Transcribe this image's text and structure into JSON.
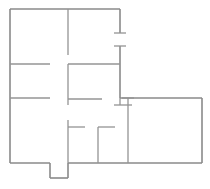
{
  "document": {
    "title": "Floor Plan",
    "type": "architectural-floor-plan",
    "canvas": {
      "width": 210,
      "height": 189,
      "background": "#ffffff"
    }
  },
  "style": {
    "wall_color": "#8f8f8f",
    "exterior_wall_color": "#8a8a8a",
    "interior_wall_color": "#949494",
    "exterior_wall_thickness": 1.6,
    "interior_wall_thickness": 1.3,
    "door_jamb_thickness": 1.3
  },
  "geometry": {
    "exterior_outline": {
      "name": "building-outline",
      "points": [
        [
          10,
          9
        ],
        [
          120,
          9
        ],
        [
          120,
          33
        ],
        [
          120,
          46
        ],
        [
          120,
          98
        ],
        [
          202,
          98
        ],
        [
          202,
          163
        ],
        [
          68,
          163
        ],
        [
          68,
          178
        ],
        [
          50,
          178
        ],
        [
          50,
          163
        ],
        [
          10,
          163
        ]
      ],
      "description": "L-shaped building footprint with small bottom alcove notch"
    },
    "exterior_segments": [
      {
        "name": "exterior-wall-top",
        "x1": 10,
        "y1": 9,
        "x2": 120,
        "y2": 9,
        "orientation": "horizontal"
      },
      {
        "name": "exterior-wall-left",
        "x1": 10,
        "y1": 9,
        "x2": 10,
        "y2": 163,
        "orientation": "vertical"
      },
      {
        "name": "exterior-wall-right-upper",
        "x1": 120,
        "y1": 9,
        "x2": 120,
        "y2": 33,
        "orientation": "vertical"
      },
      {
        "name": "exterior-wall-right-middle",
        "x1": 120,
        "y1": 46,
        "x2": 120,
        "y2": 98,
        "orientation": "vertical"
      },
      {
        "name": "exterior-wall-wing-top",
        "x1": 120,
        "y1": 98,
        "x2": 202,
        "y2": 98,
        "orientation": "horizontal"
      },
      {
        "name": "exterior-wall-wing-right",
        "x1": 202,
        "y1": 98,
        "x2": 202,
        "y2": 163,
        "orientation": "vertical"
      },
      {
        "name": "exterior-wall-bottom-right",
        "x1": 202,
        "y1": 163,
        "x2": 68,
        "y2": 163,
        "orientation": "horizontal"
      },
      {
        "name": "exterior-wall-bottom-left",
        "x1": 50,
        "y1": 163,
        "x2": 10,
        "y2": 163,
        "orientation": "horizontal"
      },
      {
        "name": "alcove-wall-right",
        "x1": 68,
        "y1": 163,
        "x2": 68,
        "y2": 178,
        "orientation": "vertical"
      },
      {
        "name": "alcove-wall-bottom",
        "x1": 68,
        "y1": 178,
        "x2": 50,
        "y2": 178,
        "orientation": "horizontal"
      },
      {
        "name": "alcove-wall-left",
        "x1": 50,
        "y1": 178,
        "x2": 50,
        "y2": 163,
        "orientation": "vertical"
      }
    ],
    "interior_segments": [
      {
        "name": "interior-wall-upper-vertical-divider",
        "x1": 68,
        "y1": 9,
        "x2": 68,
        "y2": 55,
        "orientation": "vertical"
      },
      {
        "name": "interior-wall-left-upper-partition",
        "x1": 10,
        "y1": 64,
        "x2": 50,
        "y2": 64,
        "orientation": "horizontal"
      },
      {
        "name": "interior-wall-left-lower-partition",
        "x1": 10,
        "y1": 98,
        "x2": 50,
        "y2": 98,
        "orientation": "horizontal"
      },
      {
        "name": "interior-wall-center-room-top",
        "x1": 68,
        "y1": 64,
        "x2": 120,
        "y2": 64,
        "orientation": "horizontal"
      },
      {
        "name": "interior-wall-center-room-left",
        "x1": 68,
        "y1": 64,
        "x2": 68,
        "y2": 105,
        "orientation": "vertical"
      },
      {
        "name": "interior-wall-center-room-bottom",
        "x1": 68,
        "y1": 99,
        "x2": 102,
        "y2": 99,
        "orientation": "horizontal"
      },
      {
        "name": "interior-wall-center-room-right",
        "x1": 120,
        "y1": 98,
        "x2": 120,
        "y2": 105,
        "orientation": "vertical"
      },
      {
        "name": "interior-wall-lower-vertical-divider",
        "x1": 68,
        "y1": 120,
        "x2": 68,
        "y2": 163,
        "orientation": "vertical"
      },
      {
        "name": "interior-wall-closet-left-stub",
        "x1": 68,
        "y1": 127,
        "x2": 85,
        "y2": 127,
        "orientation": "horizontal"
      },
      {
        "name": "interior-wall-closet-right-stub",
        "x1": 98,
        "y1": 127,
        "x2": 115,
        "y2": 127,
        "orientation": "horizontal"
      },
      {
        "name": "interior-wall-closet-vertical",
        "x1": 98,
        "y1": 127,
        "x2": 98,
        "y2": 163,
        "orientation": "vertical"
      },
      {
        "name": "interior-wall-wing-divider",
        "x1": 128,
        "y1": 98,
        "x2": 128,
        "y2": 163,
        "orientation": "vertical"
      }
    ],
    "door_jambs": [
      {
        "name": "door-jamb-right-upper",
        "x1": 114,
        "y1": 33,
        "x2": 126,
        "y2": 33,
        "orientation": "horizontal"
      },
      {
        "name": "door-jamb-right-lower",
        "x1": 114,
        "y1": 46,
        "x2": 126,
        "y2": 46,
        "orientation": "horizontal"
      },
      {
        "name": "door-jamb-wing-entry",
        "x1": 122,
        "y1": 98,
        "x2": 134,
        "y2": 98,
        "orientation": "horizontal"
      },
      {
        "name": "door-jamb-center-lower",
        "x1": 114,
        "y1": 105,
        "x2": 132,
        "y2": 105,
        "orientation": "horizontal"
      }
    ],
    "door_openings": [
      {
        "name": "door-opening-right-wall",
        "wall": "exterior-wall-right",
        "from": [
          120,
          33
        ],
        "to": [
          120,
          46
        ],
        "width": 13
      },
      {
        "name": "door-opening-bottom-alcove",
        "wall": "exterior-wall-bottom",
        "from": [
          50,
          163
        ],
        "to": [
          68,
          163
        ],
        "width": 18
      },
      {
        "name": "door-opening-left-upper-partition",
        "wall": "interior-wall-left-upper-partition",
        "from": [
          50,
          64
        ],
        "to": [
          68,
          64
        ],
        "width": 18
      },
      {
        "name": "door-opening-left-lower-partition",
        "wall": "interior-wall-left-lower-partition",
        "from": [
          50,
          98
        ],
        "to": [
          68,
          98
        ],
        "width": 18
      },
      {
        "name": "door-opening-center-room-bottom",
        "wall": "interior-wall-center-room-bottom",
        "from": [
          102,
          99
        ],
        "to": [
          120,
          99
        ],
        "width": 18
      },
      {
        "name": "door-opening-lower-divider",
        "wall": "interior-wall-lower-vertical-divider",
        "from": [
          68,
          105
        ],
        "to": [
          68,
          120
        ],
        "width": 15
      },
      {
        "name": "door-opening-closet",
        "wall": "interior-wall-closet",
        "from": [
          85,
          127
        ],
        "to": [
          98,
          127
        ],
        "width": 13
      }
    ]
  }
}
